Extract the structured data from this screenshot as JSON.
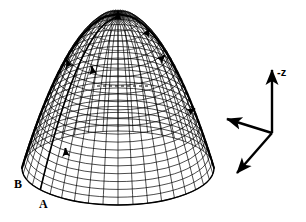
{
  "figure": {
    "background_color": "#ffffff",
    "ink_color": "#000000",
    "width": 306,
    "height": 222
  },
  "surface": {
    "name": "paraboloid-mesh",
    "shape": "paraboloid",
    "apex": {
      "x": 118,
      "y": 14
    },
    "base_center": {
      "x": 118,
      "y": 168
    },
    "base_radius_x": 96,
    "base_radius_y": 37,
    "height": 154,
    "mesh": {
      "style": "diamond-crosshatch",
      "meridian_count": 40,
      "parallel_count": 22,
      "line_color": "#000000",
      "line_width": 0.7
    },
    "shading": {
      "left_limb_dark": true,
      "right_limb_dark": true,
      "dark_meridian_x_fraction": 0.22
    }
  },
  "annotations": {
    "dashed_line": {
      "name": "horizontal-dashed-line",
      "x1": 97,
      "y1": 86,
      "x2": 152,
      "y2": 86,
      "dash": "3 3"
    },
    "surface_markers": [
      {
        "name": "marker-apex",
        "x": 118,
        "y": 19,
        "angle": -90
      },
      {
        "name": "marker-upper-right",
        "x": 146,
        "y": 35,
        "angle": -60
      },
      {
        "name": "marker-right",
        "x": 160,
        "y": 60,
        "angle": -45
      },
      {
        "name": "marker-upper-left",
        "x": 69,
        "y": 66,
        "angle": -110
      },
      {
        "name": "marker-mid-left",
        "x": 93,
        "y": 73,
        "angle": -100
      },
      {
        "name": "marker-far-right",
        "x": 189,
        "y": 112,
        "angle": -30
      },
      {
        "name": "marker-lower-left",
        "x": 66,
        "y": 155,
        "angle": -95
      }
    ]
  },
  "axes": {
    "name": "coordinate-axis-triad",
    "origin": {
      "x": 272,
      "y": 133
    },
    "arrows": [
      {
        "name": "axis-arrow-minus-z",
        "label": "-z",
        "tip_x": 272,
        "tip_y": 70
      },
      {
        "name": "axis-arrow-upper-left",
        "label": "",
        "tip_x": 227,
        "tip_y": 119
      },
      {
        "name": "axis-arrow-lower-left",
        "label": "",
        "tip_x": 237,
        "tip_y": 173
      }
    ],
    "z_label": "-z"
  },
  "labels": {
    "point_a": "A",
    "point_b": "B"
  }
}
